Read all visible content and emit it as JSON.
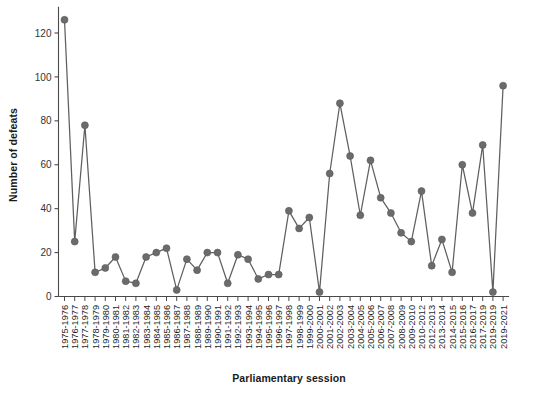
{
  "chart_data": {
    "type": "line",
    "title": "",
    "subtitle": "",
    "xlabel": "Parliamentary session",
    "ylabel": "Number of defeats",
    "ylim": [
      0,
      132
    ],
    "yticks": [
      0,
      20,
      40,
      60,
      80,
      100,
      120
    ],
    "ytick_labels": [
      "0",
      "20",
      "40",
      "60",
      "80",
      "100",
      "120"
    ],
    "grid": false,
    "legend": null,
    "legend_position": "none",
    "marker": "circle",
    "line_color": "#5f5f5f",
    "marker_color": "#6b6b6b",
    "categories": [
      "1975-1976",
      "1976-1977",
      "1977-1978",
      "1978-1979",
      "1979-1980",
      "1980-1981",
      "1981-1982",
      "1982-1983",
      "1983-1984",
      "1984-1985",
      "1985-1986",
      "1986-1987",
      "1987-1988",
      "1988-1989",
      "1989-1990",
      "1990-1991",
      "1991-1992",
      "1992-1993",
      "1993-1994",
      "1994-1995",
      "1995-1996",
      "1996-1997",
      "1997-1998",
      "1998-1999",
      "1999-2000",
      "2000-2001",
      "2001-2002",
      "2002-2003",
      "2003-2004",
      "2004-2005",
      "2005-2006",
      "2006-2007",
      "2007-2008",
      "2008-2009",
      "2009-2010",
      "2010-2012",
      "2012-2013",
      "2013-2014",
      "2014-2015",
      "2015-2016",
      "2016-2017",
      "2017-2019",
      "2019-2019",
      "2019-2021"
    ],
    "values": [
      126,
      25,
      78,
      11,
      13,
      18,
      7,
      6,
      18,
      20,
      22,
      3,
      17,
      12,
      20,
      20,
      6,
      19,
      17,
      8,
      10,
      10,
      39,
      31,
      36,
      2,
      56,
      88,
      64,
      37,
      62,
      45,
      38,
      29,
      25,
      48,
      14,
      26,
      11,
      60,
      38,
      69,
      2,
      96
    ],
    "point_labels": []
  },
  "axis": {
    "y_title": "Number of defeats",
    "x_title": "Parliamentary session"
  }
}
